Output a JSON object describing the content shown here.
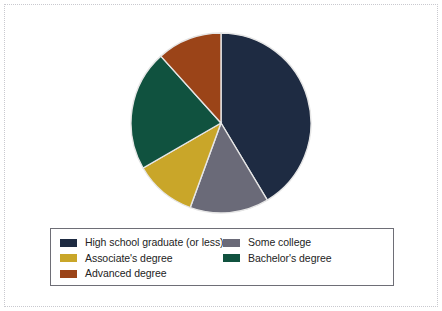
{
  "chart_data": {
    "type": "pie",
    "title": "",
    "subtitle": "",
    "xlabel": "",
    "ylabel": "",
    "legend_position": "bottom",
    "grid": false,
    "start_angle_deg": 0,
    "direction": "clockwise",
    "categories": [
      "High school graduate (or less)",
      "Some college",
      "Associate's degree",
      "Bachelor's degree",
      "Advanced degree"
    ],
    "values": [
      41.4,
      14.2,
      11.1,
      21.7,
      11.7
    ],
    "units": "percent",
    "slices": [
      {
        "label": "High school graduate (or less)",
        "value": 41.4,
        "color": "#1e2b42",
        "start_deg": 0,
        "end_deg": 149
      },
      {
        "label": "Some college",
        "value": 14.2,
        "color": "#6a6a78",
        "start_deg": 149,
        "end_deg": 200
      },
      {
        "label": "Associate's degree",
        "value": 11.1,
        "color": "#c9a629",
        "start_deg": 200,
        "end_deg": 240
      },
      {
        "label": "Bachelor's degree",
        "value": 21.7,
        "color": "#10523f",
        "start_deg": 240,
        "end_deg": 318
      },
      {
        "label": "Advanced degree",
        "value": 11.7,
        "color": "#9b4418",
        "start_deg": 318,
        "end_deg": 360
      }
    ]
  },
  "legend": {
    "items": [
      {
        "label": "High school graduate (or less)",
        "color": "#1e2b42"
      },
      {
        "label": "Some college",
        "color": "#6a6a78"
      },
      {
        "label": "Associate's degree",
        "color": "#c9a629"
      },
      {
        "label": "Bachelor's degree",
        "color": "#10523f"
      },
      {
        "label": "Advanced degree",
        "color": "#9b4418"
      }
    ]
  },
  "colors": {
    "high_school": "#1e2b42",
    "some_college": "#6a6a78",
    "associates": "#c9a629",
    "bachelors": "#10523f",
    "advanced": "#9b4418",
    "slice_divider": "#e6e6e6",
    "legend_border": "#6e6e76",
    "page_border": "#c9c9cf",
    "background": "#ffffff",
    "text": "#232323"
  }
}
